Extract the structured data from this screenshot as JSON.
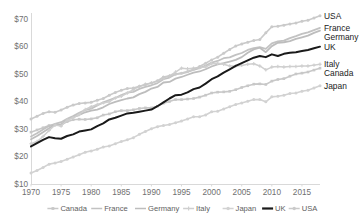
{
  "chart_data": {
    "type": "line",
    "title": "",
    "subtitle": "",
    "xlabel": "",
    "ylabel": "",
    "xlim": [
      1970,
      2018
    ],
    "ylim": [
      10,
      72
    ],
    "yticks": [
      10,
      20,
      30,
      40,
      50,
      60,
      70
    ],
    "ytick_labels": [
      "$10",
      "$20",
      "$30",
      "$40",
      "$50",
      "$60",
      "$70"
    ],
    "xticks": [
      1970,
      1975,
      1980,
      1985,
      1990,
      1995,
      2000,
      2005,
      2010,
      2015
    ],
    "xtick_labels": [
      "1970",
      "1975",
      "1980",
      "1985",
      "1990",
      "1995",
      "2000",
      "2005",
      "2010",
      "2015"
    ],
    "grid": false,
    "legend_position": "bottom",
    "x": [
      1970,
      1971,
      1972,
      1973,
      1974,
      1975,
      1976,
      1977,
      1978,
      1979,
      1980,
      1981,
      1982,
      1983,
      1984,
      1985,
      1986,
      1987,
      1988,
      1989,
      1990,
      1991,
      1992,
      1993,
      1994,
      1995,
      1996,
      1997,
      1998,
      1999,
      2000,
      2001,
      2002,
      2003,
      2004,
      2005,
      2006,
      2007,
      2008,
      2009,
      2010,
      2011,
      2012,
      2013,
      2014,
      2015,
      2016,
      2017,
      2018
    ],
    "series": [
      {
        "name": "Canada",
        "color": "#c8c8c8",
        "marker": "square",
        "width": 1.6,
        "end_label": "Canada",
        "values": [
          28.8,
          29.6,
          30.4,
          31.2,
          31.4,
          31.4,
          32.6,
          33.3,
          33.5,
          33.4,
          33.6,
          34.0,
          35.0,
          35.4,
          36.2,
          36.6,
          36.6,
          36.9,
          37.4,
          37.6,
          37.6,
          38.2,
          39.3,
          39.9,
          40.6,
          40.6,
          40.8,
          41.0,
          41.5,
          42.2,
          43.0,
          43.3,
          43.4,
          43.6,
          44.2,
          45.0,
          45.6,
          46.2,
          46.3,
          46.1,
          47.3,
          47.9,
          48.2,
          49.1,
          49.9,
          50.2,
          50.6,
          51.3,
          52.0
        ]
      },
      {
        "name": "France",
        "color": "#c2c2c2",
        "marker": "none",
        "width": 1.8,
        "end_label": "France",
        "values": [
          27.2,
          28.4,
          29.8,
          31.0,
          31.8,
          32.4,
          33.6,
          34.6,
          35.8,
          36.8,
          37.3,
          38.5,
          39.6,
          40.4,
          41.2,
          42.2,
          43.1,
          43.4,
          44.5,
          45.2,
          45.8,
          46.6,
          48.0,
          48.6,
          49.8,
          50.1,
          50.6,
          51.4,
          52.0,
          52.9,
          54.0,
          54.6,
          55.6,
          55.9,
          56.8,
          57.5,
          58.6,
          59.3,
          59.6,
          59.0,
          61.0,
          61.7,
          62.0,
          62.9,
          63.6,
          64.4,
          65.0,
          65.8,
          66.6
        ]
      },
      {
        "name": "Germany",
        "color": "#bdbdbd",
        "marker": "none",
        "width": 1.8,
        "end_label": "Germany",
        "values": [
          26.2,
          27.4,
          28.8,
          30.2,
          31.4,
          31.6,
          33.2,
          34.2,
          35.0,
          36.0,
          36.6,
          37.0,
          37.8,
          39.0,
          39.8,
          40.4,
          41.0,
          41.4,
          42.6,
          43.4,
          44.6,
          45.2,
          46.8,
          47.0,
          48.2,
          48.8,
          49.6,
          50.4,
          50.8,
          51.6,
          52.6,
          53.4,
          53.8,
          54.4,
          55.0,
          56.0,
          57.6,
          58.8,
          59.4,
          57.8,
          60.0,
          61.2,
          61.4,
          61.8,
          62.6,
          63.2,
          63.8,
          64.8,
          65.6
        ]
      },
      {
        "name": "Italy",
        "color": "#cfcfcf",
        "marker": "plus",
        "width": 1.5,
        "end_label": "Italy",
        "values": [
          24.6,
          25.4,
          27.2,
          29.4,
          31.4,
          31.0,
          33.2,
          34.0,
          35.2,
          37.0,
          38.0,
          38.8,
          39.4,
          39.8,
          41.2,
          41.8,
          43.0,
          44.2,
          45.4,
          46.2,
          46.6,
          47.2,
          48.4,
          49.2,
          50.6,
          52.0,
          51.8,
          52.0,
          52.2,
          52.4,
          53.6,
          53.8,
          53.4,
          52.8,
          52.8,
          53.0,
          53.4,
          53.6,
          52.8,
          51.4,
          52.4,
          52.6,
          52.4,
          52.6,
          52.6,
          52.8,
          52.8,
          53.1,
          53.4
        ]
      },
      {
        "name": "Japan",
        "color": "#d2d2d2",
        "marker": "circle",
        "width": 1.6,
        "end_label": "Japan",
        "values": [
          14.0,
          14.9,
          16.0,
          17.2,
          17.6,
          18.2,
          19.0,
          19.8,
          20.6,
          21.5,
          22.0,
          22.6,
          23.4,
          23.8,
          24.6,
          25.4,
          26.0,
          26.8,
          28.0,
          29.0,
          30.0,
          30.8,
          31.2,
          31.6,
          32.2,
          32.8,
          33.6,
          34.4,
          34.4,
          35.0,
          36.2,
          36.4,
          37.2,
          38.0,
          38.8,
          39.4,
          40.0,
          40.6,
          40.6,
          39.8,
          41.6,
          41.8,
          42.2,
          42.8,
          43.0,
          43.6,
          44.0,
          44.8,
          45.6
        ]
      },
      {
        "name": "UK",
        "color": "#1a1a1a",
        "marker": "none",
        "width": 2.0,
        "end_label": "UK",
        "values": [
          23.6,
          24.8,
          26.0,
          27.0,
          26.6,
          26.4,
          27.4,
          28.0,
          29.0,
          29.4,
          29.8,
          31.0,
          32.0,
          33.4,
          34.0,
          34.8,
          35.6,
          35.8,
          36.2,
          36.6,
          37.0,
          38.2,
          39.6,
          41.0,
          42.2,
          42.4,
          43.2,
          44.4,
          45.0,
          46.4,
          48.0,
          49.0,
          50.4,
          51.6,
          52.8,
          53.8,
          54.8,
          55.8,
          56.4,
          56.0,
          57.0,
          56.4,
          57.2,
          57.6,
          57.8,
          58.2,
          58.6,
          59.2,
          59.8
        ]
      },
      {
        "name": "USA",
        "color": "#cacaca",
        "marker": "circle",
        "width": 1.6,
        "end_label": "USA",
        "values": [
          33.6,
          34.6,
          35.6,
          36.2,
          36.0,
          36.8,
          37.8,
          38.6,
          39.2,
          39.4,
          39.6,
          40.4,
          41.0,
          42.2,
          43.2,
          44.0,
          44.6,
          44.8,
          45.4,
          46.0,
          46.6,
          47.4,
          48.8,
          49.2,
          49.8,
          50.2,
          50.8,
          51.6,
          52.6,
          53.8,
          55.0,
          56.0,
          57.4,
          58.8,
          60.0,
          60.8,
          61.4,
          62.0,
          62.4,
          64.8,
          67.0,
          67.2,
          67.6,
          68.0,
          68.4,
          69.0,
          69.4,
          70.2,
          71.0
        ]
      }
    ],
    "legend": [
      {
        "label": "Canada",
        "color": "#c8c8c8",
        "marker": "square"
      },
      {
        "label": "France",
        "color": "#c2c2c2",
        "marker": "none"
      },
      {
        "label": "Germany",
        "color": "#bdbdbd",
        "marker": "none"
      },
      {
        "label": "Italy",
        "color": "#cfcfcf",
        "marker": "plus"
      },
      {
        "label": "Japan",
        "color": "#d2d2d2",
        "marker": "circle"
      },
      {
        "label": "UK",
        "color": "#1a1a1a",
        "marker": "none"
      },
      {
        "label": "USA",
        "color": "#cacaca",
        "marker": "circle"
      }
    ],
    "end_labels": [
      {
        "label": "USA",
        "value": 71.0
      },
      {
        "label": "France",
        "value": 66.6
      },
      {
        "label": "Germany",
        "value": 65.6
      },
      {
        "label": "UK",
        "value": 59.8
      },
      {
        "label": "Italy",
        "value": 53.4
      },
      {
        "label": "Canada",
        "value": 52.0
      },
      {
        "label": "Japan",
        "value": 45.6
      }
    ]
  }
}
